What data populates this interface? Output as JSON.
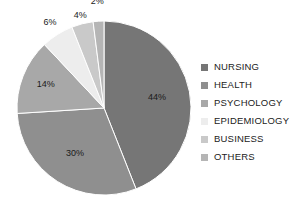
{
  "chart_data": {
    "type": "pie",
    "title": "",
    "subtitle": "",
    "xlabel": "",
    "ylabel": "",
    "grid": false,
    "legend_position": "right",
    "start_angle_deg": 0,
    "direction": "clockwise",
    "categories": [
      "NURSING",
      "HEALTH",
      "PSYCHOLOGY",
      "EPIDEMIOLOGY",
      "BUSINESS",
      "OTHERS"
    ],
    "values": [
      44,
      30,
      14,
      6,
      4,
      2
    ],
    "value_unit": "%",
    "data_labels": [
      "44%",
      "30%",
      "14%",
      "6%",
      "4%",
      "2%"
    ],
    "colors": [
      "#767676",
      "#8f8f8f",
      "#a8a8a8",
      "#ededed",
      "#c9c9c9",
      "#b5b5b5"
    ],
    "slices": [
      {
        "label": "NURSING",
        "value": 44,
        "data_label": "44%",
        "color": "#767676"
      },
      {
        "label": "HEALTH",
        "value": 30,
        "data_label": "30%",
        "color": "#8f8f8f"
      },
      {
        "label": "PSYCHOLOGY",
        "value": 14,
        "data_label": "14%",
        "color": "#a8a8a8"
      },
      {
        "label": "EPIDEMIOLOGY",
        "value": 6,
        "data_label": "6%",
        "color": "#ededed"
      },
      {
        "label": "BUSINESS",
        "value": 4,
        "data_label": "4%",
        "color": "#c9c9c9"
      },
      {
        "label": "OTHERS",
        "value": 2,
        "data_label": "2%",
        "color": "#b5b5b5"
      }
    ]
  },
  "legend": {
    "items": [
      {
        "label": "NURSING",
        "color": "#767676"
      },
      {
        "label": "HEALTH",
        "color": "#8f8f8f"
      },
      {
        "label": "PSYCHOLOGY",
        "color": "#a8a8a8"
      },
      {
        "label": "EPIDEMIOLOGY",
        "color": "#ededed"
      },
      {
        "label": "BUSINESS",
        "color": "#c9c9c9"
      },
      {
        "label": "OTHERS",
        "color": "#b5b5b5"
      }
    ]
  }
}
